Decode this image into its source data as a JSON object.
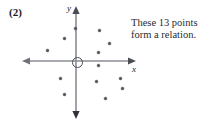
{
  "figure": {
    "problem_number": "(2)",
    "width": 219,
    "height": 124
  },
  "caption": {
    "line1": "These 13 points",
    "line2": "form a relation."
  },
  "axes": {
    "x_label": "x",
    "y_label": "y",
    "origin_marker": "circle",
    "x_axis_arrows": "both",
    "y_axis_arrows": "both",
    "axis_color": "#8a8d93",
    "point_color": "#53565c"
  },
  "chart_data": {
    "type": "scatter",
    "title": "",
    "subtitle": "",
    "xlabel": "x",
    "ylabel": "y",
    "grid": false,
    "legend": null,
    "point_count": 13,
    "annotations": [
      "These 13 points form a relation."
    ],
    "axis_origin_px": {
      "x": 76,
      "y": 61
    },
    "xlim_px": [
      22,
      136
    ],
    "ylim_px": [
      6,
      119
    ],
    "points_px": [
      {
        "x": 75,
        "y": 28
      },
      {
        "x": 64,
        "y": 38
      },
      {
        "x": 47,
        "y": 50
      },
      {
        "x": 99,
        "y": 30
      },
      {
        "x": 109,
        "y": 43
      },
      {
        "x": 98,
        "y": 52
      },
      {
        "x": 98,
        "y": 65
      },
      {
        "x": 120,
        "y": 78
      },
      {
        "x": 122,
        "y": 88
      },
      {
        "x": 96,
        "y": 81
      },
      {
        "x": 105,
        "y": 98
      },
      {
        "x": 60,
        "y": 78
      },
      {
        "x": 64,
        "y": 94
      }
    ],
    "x": [
      -0.2,
      -2.4,
      -5.8,
      4.6,
      6.6,
      4.4,
      4.4,
      8.8,
      9.2,
      4.0,
      5.8,
      -3.2,
      -2.4
    ],
    "y": [
      6.6,
      4.6,
      2.2,
      6.2,
      3.6,
      1.8,
      -0.8,
      -3.4,
      -5.4,
      -4.0,
      -7.4,
      -3.4,
      -6.6
    ]
  }
}
